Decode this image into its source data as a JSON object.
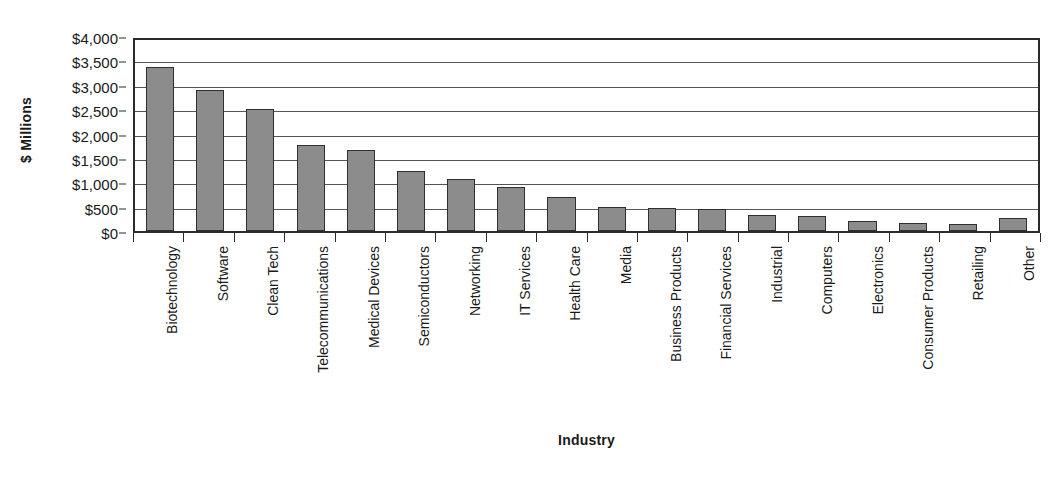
{
  "chart_data": {
    "type": "bar",
    "title": "",
    "xlabel": "Industry",
    "ylabel": "$ Millions",
    "ylim": [
      0,
      4000
    ],
    "ytick_labels": [
      "$4,000",
      "$3,500",
      "$3,000",
      "$2,500",
      "$2,000",
      "$1,500",
      "$1,000",
      "$500",
      "$0"
    ],
    "ytick_values": [
      4000,
      3500,
      3000,
      2500,
      2000,
      1500,
      1000,
      500,
      0
    ],
    "grid": "horizontal",
    "legend": "none",
    "bar_color": "#8c8c8c",
    "bar_border_color": "#2f2f2f",
    "axis_color": "#2b2b2b",
    "gridline_color": "#555555",
    "background_color": "#ffffff",
    "categories": [
      "Biotechnology",
      "Software",
      "Clean Tech",
      "Telecommunications",
      "Medical Devices",
      "Semiconductors",
      "Networking",
      "IT Services",
      "Health Care",
      "Media",
      "Business Products",
      "Financial Services",
      "Industrial",
      "Computers",
      "Electronics",
      "Consumer Products",
      "Retailing",
      "Other"
    ],
    "values": [
      3400,
      2920,
      2530,
      1780,
      1680,
      1240,
      1070,
      920,
      710,
      500,
      480,
      450,
      340,
      310,
      210,
      170,
      150,
      280
    ]
  }
}
